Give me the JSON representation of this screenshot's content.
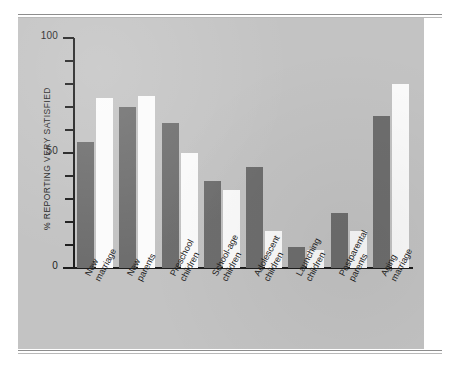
{
  "figure": {
    "panel_color": "#c3c3c3",
    "axis_color": "#1d1d1d"
  },
  "axis": {
    "y_title": "% REPORTING VERY SATISFIED",
    "major_ticks": [
      "0",
      "50",
      "100"
    ],
    "minor_tick_values": [
      10,
      20,
      30,
      40,
      60,
      70,
      80,
      90
    ]
  },
  "legend": {
    "series_colors": {
      "husbands": "#6e6e6e",
      "wives": "#fbfbfb"
    }
  },
  "chart_data": {
    "type": "bar",
    "title": "",
    "subtitle": "",
    "xlabel": "",
    "ylabel": "% REPORTING VERY SATISFIED",
    "ylim": [
      0,
      100
    ],
    "yticks": [
      0,
      10,
      20,
      30,
      40,
      50,
      60,
      70,
      80,
      90,
      100
    ],
    "ytick_labels_shown": [
      0,
      50,
      100
    ],
    "grid": false,
    "legend_position": "none",
    "categories": [
      "New marriage",
      "New parents",
      "Preschool children",
      "School-age children",
      "Adolescent children",
      "Launching children",
      "Postparental parents",
      "Aging marriage"
    ],
    "category_lines": [
      [
        "New",
        "marriage"
      ],
      [
        "New",
        "parents"
      ],
      [
        "Preschool",
        "children"
      ],
      [
        "School-age",
        "children"
      ],
      [
        "Adolescent",
        "children"
      ],
      [
        "Launching",
        "children"
      ],
      [
        "Postparental",
        "parents"
      ],
      [
        "Aging",
        "marriage"
      ]
    ],
    "series": [
      {
        "name": "Series 1",
        "color": "#6e6e6e",
        "values": [
          55,
          70,
          63,
          38,
          44,
          9,
          24,
          66
        ]
      },
      {
        "name": "Series 2",
        "color": "#fbfbfb",
        "values": [
          74,
          75,
          50,
          34,
          16,
          8,
          16,
          80
        ]
      }
    ]
  }
}
